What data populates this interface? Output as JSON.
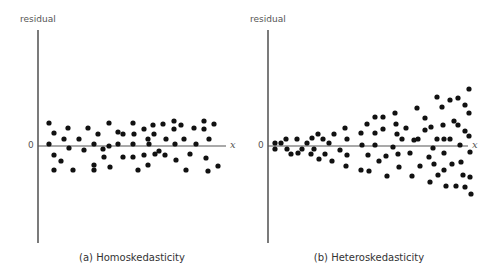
{
  "chart_data": [
    {
      "type": "scatter",
      "title": "(a) Homoskedasticity",
      "xlabel": "x",
      "ylabel": "residual",
      "y_zero_label": "0",
      "grid": false,
      "description": "Residuals scattered in a band of constant width around zero across all x",
      "points_px": [
        [
          49,
          123
        ],
        [
          54,
          133
        ],
        [
          49,
          144
        ],
        [
          54,
          155
        ],
        [
          54,
          170
        ],
        [
          64,
          139
        ],
        [
          61,
          161
        ],
        [
          69,
          148
        ],
        [
          68,
          128
        ],
        [
          73,
          170
        ],
        [
          79,
          139
        ],
        [
          84,
          150
        ],
        [
          88,
          128
        ],
        [
          94,
          144
        ],
        [
          94,
          165
        ],
        [
          94,
          170
        ],
        [
          98,
          134
        ],
        [
          103,
          149
        ],
        [
          104,
          157
        ],
        [
          109,
          123
        ],
        [
          109,
          146
        ],
        [
          110,
          167
        ],
        [
          118,
          132
        ],
        [
          118,
          144
        ],
        [
          123,
          134
        ],
        [
          123,
          157
        ],
        [
          133,
          123
        ],
        [
          134,
          134
        ],
        [
          133,
          144
        ],
        [
          133,
          157
        ],
        [
          138,
          170
        ],
        [
          144,
          129
        ],
        [
          144,
          155
        ],
        [
          148,
          139
        ],
        [
          149,
          144
        ],
        [
          153,
          125
        ],
        [
          154,
          134
        ],
        [
          155,
          154
        ],
        [
          148,
          165
        ],
        [
          159,
          151
        ],
        [
          163,
          124
        ],
        [
          166,
          139
        ],
        [
          165,
          155
        ],
        [
          174,
          121
        ],
        [
          174,
          129
        ],
        [
          175,
          144
        ],
        [
          176,
          160
        ],
        [
          181,
          125
        ],
        [
          184,
          139
        ],
        [
          186,
          170
        ],
        [
          194,
          128
        ],
        [
          190,
          154
        ],
        [
          196,
          144
        ],
        [
          204,
          121
        ],
        [
          204,
          129
        ],
        [
          206,
          158
        ],
        [
          209,
          139
        ],
        [
          208,
          171
        ],
        [
          214,
          124
        ],
        [
          218,
          166
        ]
      ],
      "y_range_px": [
        121,
        171
      ],
      "zero_line_y_px": 146
    },
    {
      "type": "scatter",
      "title": "(b) Heteroskedasticity",
      "xlabel": "x",
      "ylabel": "residual",
      "y_zero_label": "0",
      "grid": false,
      "description": "Residual spread widens as x increases (fan shape)",
      "points_px": [
        [
          275,
          143
        ],
        [
          275,
          149
        ],
        [
          281,
          143
        ],
        [
          286,
          139
        ],
        [
          287,
          149
        ],
        [
          291,
          154
        ],
        [
          297,
          139
        ],
        [
          298,
          153
        ],
        [
          302,
          149
        ],
        [
          307,
          143
        ],
        [
          311,
          154
        ],
        [
          312,
          138
        ],
        [
          314,
          149
        ],
        [
          318,
          134
        ],
        [
          319,
          159
        ],
        [
          323,
          139
        ],
        [
          325,
          154
        ],
        [
          329,
          143
        ],
        [
          332,
          161
        ],
        [
          334,
          134
        ],
        [
          340,
          150
        ],
        [
          345,
          128
        ],
        [
          347,
          139
        ],
        [
          347,
          155
        ],
        [
          346,
          166
        ],
        [
          361,
          133
        ],
        [
          361,
          170
        ],
        [
          362,
          145
        ],
        [
          367,
          124
        ],
        [
          368,
          155
        ],
        [
          369,
          171
        ],
        [
          375,
          117
        ],
        [
          375,
          133
        ],
        [
          375,
          145
        ],
        [
          379,
          161
        ],
        [
          383,
          117
        ],
        [
          383,
          129
        ],
        [
          386,
          156
        ],
        [
          387,
          176
        ],
        [
          393,
          147
        ],
        [
          395,
          113
        ],
        [
          396,
          124
        ],
        [
          397,
          134
        ],
        [
          398,
          154
        ],
        [
          399,
          167
        ],
        [
          402,
          139
        ],
        [
          406,
          128
        ],
        [
          410,
          153
        ],
        [
          412,
          176
        ],
        [
          417,
          108
        ],
        [
          418,
          139
        ],
        [
          420,
          166
        ],
        [
          425,
          118
        ],
        [
          425,
          130
        ],
        [
          414,
          140
        ],
        [
          429,
          157
        ],
        [
          430,
          182
        ],
        [
          431,
          127
        ],
        [
          433,
          148
        ],
        [
          434,
          164
        ],
        [
          437,
          97
        ],
        [
          437,
          139
        ],
        [
          438,
          175
        ],
        [
          442,
          107
        ],
        [
          443,
          125
        ],
        [
          444,
          139
        ],
        [
          444,
          153
        ],
        [
          444,
          170
        ],
        [
          446,
          186
        ],
        [
          450,
          100
        ],
        [
          450,
          139
        ],
        [
          452,
          164
        ],
        [
          454,
          121
        ],
        [
          456,
          186
        ],
        [
          458,
          98
        ],
        [
          458,
          125
        ],
        [
          460,
          145
        ],
        [
          461,
          162
        ],
        [
          463,
          175
        ],
        [
          465,
          105
        ],
        [
          465,
          131
        ],
        [
          465,
          187
        ],
        [
          469,
          89
        ],
        [
          469,
          113
        ],
        [
          469,
          136
        ],
        [
          470,
          152
        ],
        [
          470,
          177
        ],
        [
          471,
          194
        ]
      ],
      "y_range_px": [
        89,
        194
      ],
      "zero_line_y_px": 146
    }
  ],
  "panels": {
    "left": {
      "ylabel": "residual",
      "zero": "0",
      "xlabel": "x",
      "caption": "(a) Homoskedasticity"
    },
    "right": {
      "ylabel": "residual",
      "zero": "0",
      "xlabel": "x",
      "caption": "(b) Heteroskedasticity"
    }
  }
}
